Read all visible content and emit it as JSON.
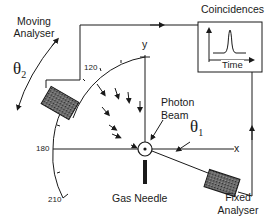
{
  "diagram": {
    "labels": {
      "moving_analyser_line1": "Moving",
      "moving_analyser_line2": "Analyser",
      "coincidences": "Coincidences",
      "time": "Time",
      "photon_line1": "Photon",
      "photon_line2": "Beam",
      "gas_needle": "Gas Needle",
      "fixed_analyser_line1": "Fixed",
      "fixed_analyser_line2": "Analyser",
      "theta2": "θ",
      "theta2_sub": "2",
      "theta1": "θ",
      "theta1_sub": "1",
      "axis_x": "x",
      "axis_y": "y",
      "angle_120": "120",
      "angle_180": "180",
      "angle_210": "210"
    },
    "colors": {
      "stroke": "#1a1a1a",
      "analyser_fill": "#555555",
      "background": "#ffffff"
    }
  }
}
